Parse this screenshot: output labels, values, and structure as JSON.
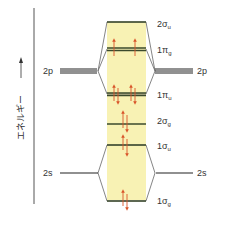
{
  "diagram": {
    "type": "molecular-orbital-energy-diagram",
    "axis_label": "エネルギー",
    "axis_arrow": "→",
    "atomic_orbitals": {
      "left": [
        {
          "id": "2p-left",
          "label": "2p"
        },
        {
          "id": "2s-left",
          "label": "2s"
        }
      ],
      "right": [
        {
          "id": "2p-right",
          "label": "2p"
        },
        {
          "id": "2s-right",
          "label": "2s"
        }
      ]
    },
    "molecular_orbitals": [
      {
        "id": "2sigma-u",
        "label_main": "2σ",
        "label_sub": "u",
        "electrons": 0
      },
      {
        "id": "1pi-g",
        "label_main": "1π",
        "label_sub": "g",
        "electrons": 2,
        "note": "two degenerate orbitals, one up-spin electron each"
      },
      {
        "id": "1pi-u",
        "label_main": "1π",
        "label_sub": "u",
        "electrons": 4,
        "note": "two degenerate orbitals, paired"
      },
      {
        "id": "2sigma-g",
        "label_main": "2σ",
        "label_sub": "g",
        "electrons": 2
      },
      {
        "id": "1sigma-u",
        "label_main": "1σ",
        "label_sub": "u",
        "electrons": 2
      },
      {
        "id": "1sigma-g",
        "label_main": "1σ",
        "label_sub": "g",
        "electrons": 2
      }
    ],
    "colors": {
      "band": "#f8f2b4",
      "level_line": "#3b4a2c",
      "connector": "#555555",
      "electron_arrow": "#d9552a",
      "text": "#333333"
    }
  }
}
